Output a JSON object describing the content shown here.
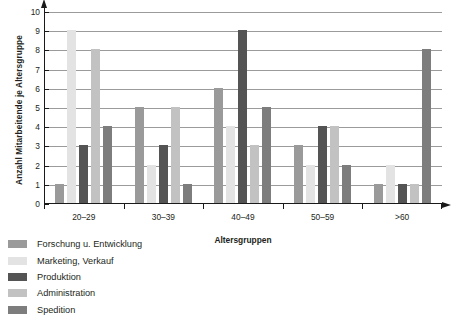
{
  "chart_data": {
    "type": "bar",
    "title": "",
    "xlabel": "Altersgruppen",
    "ylabel": "Anzahl Mitarbeitende je Altersgruppe",
    "categories": [
      "20–29",
      "30–39",
      "40–49",
      "50–59",
      ">60"
    ],
    "yticks": [
      0,
      1,
      2,
      3,
      4,
      5,
      6,
      7,
      8,
      9,
      10
    ],
    "ylim": [
      0,
      10
    ],
    "grid": true,
    "legend_position": "bottom-left",
    "series": [
      {
        "name": "Forschung u. Entwicklung",
        "color": "#9a9a9a",
        "values": [
          1,
          5,
          6,
          3,
          1
        ]
      },
      {
        "name": "Marketing, Verkauf",
        "color": "#e3e3e3",
        "values": [
          9,
          2,
          4,
          2,
          2
        ]
      },
      {
        "name": "Produktion",
        "color": "#545454",
        "values": [
          3,
          3,
          9,
          4,
          1
        ]
      },
      {
        "name": "Administration",
        "color": "#c2c2c2",
        "values": [
          8,
          5,
          3,
          4,
          1
        ]
      },
      {
        "name": "Spedition",
        "color": "#7d7d7d",
        "values": [
          4,
          1,
          5,
          2,
          8
        ]
      }
    ]
  },
  "colors": {
    "axis": "#1a1a1a",
    "grid": "#9b9b9b",
    "text": "#231f20"
  }
}
